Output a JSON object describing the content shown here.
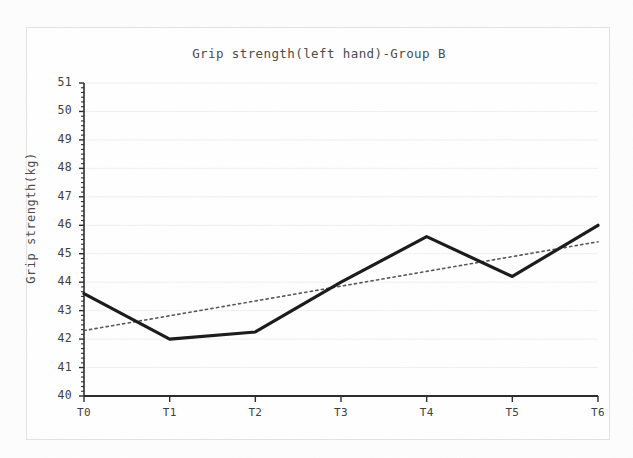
{
  "chart_data": {
    "type": "line",
    "title": "Grip strength(left hand)-Group B",
    "xlabel": "",
    "ylabel": "Grip strength(kg)",
    "categories": [
      "T0",
      "T1",
      "T2",
      "T3",
      "T4",
      "T5",
      "T6"
    ],
    "ylim": [
      40,
      51
    ],
    "ytick_labels": [
      "40",
      "41",
      "42",
      "43",
      "44",
      "45",
      "46",
      "47",
      "48",
      "49",
      "50",
      "51"
    ],
    "ytick_values": [
      40,
      41,
      42,
      43,
      44,
      45,
      46,
      47,
      48,
      49,
      50,
      51
    ],
    "grid": true,
    "grid_axis": "y",
    "legend": "none",
    "series": [
      {
        "name": "Grip strength (left hand) Group B",
        "style": "solid",
        "color": "#1a1a1a",
        "width": 3.2,
        "values": [
          43.6,
          42.0,
          42.25,
          44.0,
          45.6,
          44.2,
          46.0
        ]
      },
      {
        "name": "Linear trend",
        "style": "dotted",
        "color": "#555555",
        "width": 1.6,
        "values": [
          42.3,
          42.82,
          43.34,
          43.86,
          44.38,
          44.9,
          45.42
        ]
      }
    ],
    "colors": {
      "series_line": "#1a1a1a",
      "trend_line": "#555555",
      "grid": "#f0f0f0",
      "axis": "#2b2b2b",
      "frame": "#e3e3e3",
      "text": "#3d3d3d",
      "background": "#ffffff"
    }
  }
}
